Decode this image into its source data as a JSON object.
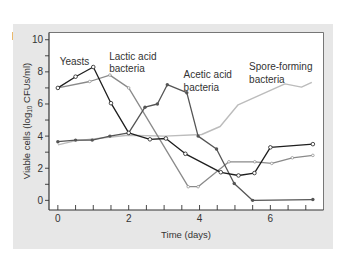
{
  "figure": {
    "panel_label": "B.",
    "panel_bg": "#e7e7e7",
    "plot_bg": "#ffffff",
    "axis_color": "#333333"
  },
  "chart_data": {
    "type": "line",
    "title": "",
    "xlabel": "Time (days)",
    "ylabel": "Viable cells (log10 CFUs/ml)",
    "ylabel_parts": {
      "pre": "Viable cells (log",
      "sub": "10",
      "post": " CFUs/ml)"
    },
    "xlim": [
      -0.25,
      7.5
    ],
    "ylim": [
      -0.6,
      10.45
    ],
    "xticks_major": [
      0,
      2,
      4,
      6
    ],
    "xticks_minor_step": 0.5,
    "yticks_major": [
      0,
      2,
      4,
      6,
      8,
      10
    ],
    "yticks_minor_step": 1,
    "grid": false,
    "legend": "inline annotations",
    "series": [
      {
        "name": "Yeasts",
        "color": "#1e1e1e",
        "marker": "open-circle",
        "x": [
          0,
          0.5,
          1.0,
          1.5,
          2.0,
          2.6,
          3.05,
          3.6,
          4.6,
          5.1,
          5.55,
          6.0,
          7.2
        ],
        "y": [
          7.0,
          7.7,
          8.3,
          6.05,
          4.2,
          3.8,
          3.85,
          2.9,
          1.75,
          1.55,
          1.7,
          3.3,
          3.5
        ]
      },
      {
        "name": "Lactic acid bacteria",
        "color": "#8a8a8a",
        "marker": "small-dot",
        "x": [
          0,
          0.9,
          1.47,
          2.0,
          3.68,
          3.96,
          4.83,
          5.56,
          6.04,
          6.62,
          7.2
        ],
        "y": [
          7.0,
          7.4,
          7.8,
          7.0,
          0.85,
          0.85,
          2.4,
          2.4,
          2.3,
          2.65,
          2.8
        ]
      },
      {
        "name": "Acetic acid bacteria",
        "color": "#555555",
        "marker": "filled-dot",
        "x": [
          0,
          0.5,
          0.97,
          1.47,
          2.0,
          2.46,
          2.81,
          3.09,
          3.64,
          3.96,
          4.48,
          4.98,
          5.5,
          7.2
        ],
        "y": [
          3.65,
          3.75,
          3.75,
          4.0,
          4.2,
          5.8,
          6.0,
          7.2,
          6.7,
          4.0,
          3.2,
          1.05,
          0.0,
          0.05
        ]
      },
      {
        "name": "Spore-forming bacteria",
        "color": "#bcbcbc",
        "marker": "none",
        "x": [
          0,
          0.48,
          1.98,
          3.02,
          4.06,
          4.58,
          5.09,
          6.41,
          6.88,
          7.17
        ],
        "y": [
          3.45,
          3.7,
          4.05,
          4.0,
          4.1,
          4.6,
          5.95,
          7.25,
          7.05,
          7.35
        ]
      }
    ],
    "annotations": [
      {
        "lines": [
          "Yeasts"
        ],
        "x": 0.05,
        "y": 8.4
      },
      {
        "lines": [
          "Lactic acid",
          "bacteria"
        ],
        "x": 1.45,
        "y": 8.75
      },
      {
        "lines": [
          "Acetic acid",
          "bacteria"
        ],
        "x": 3.55,
        "y": 7.6
      },
      {
        "lines": [
          "Spore-forming",
          "bacteria"
        ],
        "x": 5.4,
        "y": 8.1
      }
    ]
  }
}
